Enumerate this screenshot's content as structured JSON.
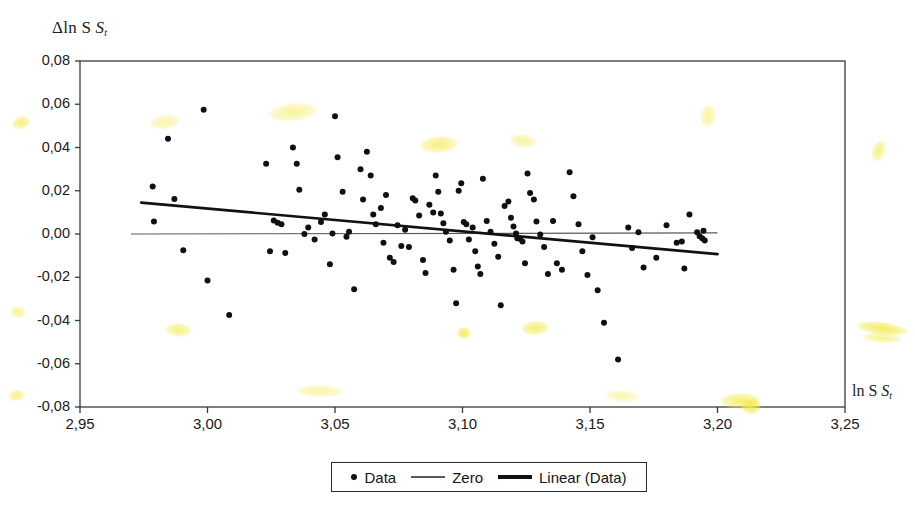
{
  "axes": {
    "y_title": "Δln S",
    "y_title_sub": "t",
    "x_title": "ln S",
    "x_title_sub": "t",
    "y_ticks": [
      "0,08",
      "0,06",
      "0,04",
      "0,02",
      "0,00",
      "-0,02",
      "-0,04",
      "-0,06",
      "-0,08"
    ],
    "x_ticks": [
      "2,95",
      "3,00",
      "3,05",
      "3,10",
      "3,15",
      "3,20",
      "3,25"
    ]
  },
  "legend": {
    "items": [
      {
        "label": "Data",
        "marker": "dot-marker"
      },
      {
        "label": "Zero",
        "marker": "thin-line-marker"
      },
      {
        "label": "Linear (Data)",
        "marker": "thick-line-marker"
      }
    ]
  },
  "colors": {
    "marker": "#101010",
    "zero_line": "#5a5a5a",
    "trend_line": "#121212",
    "axis": "#3a3a3a",
    "highlighter": "#f2ea4c"
  },
  "chart_data": {
    "type": "scatter",
    "title": "",
    "xlabel": "ln S_t",
    "ylabel": "Δln S_t",
    "xlim": [
      2.95,
      3.25
    ],
    "ylim": [
      -0.08,
      0.08
    ],
    "xticks": [
      2.95,
      3.0,
      3.05,
      3.1,
      3.15,
      3.2,
      3.25
    ],
    "yticks": [
      -0.08,
      -0.06,
      -0.04,
      -0.02,
      0.0,
      0.02,
      0.04,
      0.06,
      0.08
    ],
    "grid": false,
    "legend_position": "bottom",
    "series": [
      {
        "name": "Data",
        "type": "scatter",
        "points": [
          [
            2.9785,
            0.022
          ],
          [
            2.979,
            0.0058
          ],
          [
            2.9845,
            0.044
          ],
          [
            2.987,
            0.0162
          ],
          [
            2.9905,
            -0.0075
          ],
          [
            2.9985,
            0.0575
          ],
          [
            3.0,
            -0.0215
          ],
          [
            3.0085,
            -0.0375
          ],
          [
            3.023,
            0.0325
          ],
          [
            3.0245,
            -0.008
          ],
          [
            3.026,
            0.0062
          ],
          [
            3.0275,
            0.0052
          ],
          [
            3.029,
            0.0045
          ],
          [
            3.0305,
            -0.0088
          ],
          [
            3.0335,
            0.04
          ],
          [
            3.035,
            0.0325
          ],
          [
            3.036,
            0.0205
          ],
          [
            3.038,
            0.0
          ],
          [
            3.0395,
            0.003
          ],
          [
            3.042,
            -0.0025
          ],
          [
            3.0445,
            0.0055
          ],
          [
            3.046,
            0.009
          ],
          [
            3.048,
            -0.014
          ],
          [
            3.049,
            0.0002
          ],
          [
            3.05,
            0.0545
          ],
          [
            3.051,
            0.0355
          ],
          [
            3.053,
            0.0195
          ],
          [
            3.0545,
            -0.0013
          ],
          [
            3.0555,
            0.001
          ],
          [
            3.0575,
            -0.0255
          ],
          [
            3.06,
            0.03
          ],
          [
            3.061,
            0.016
          ],
          [
            3.0625,
            0.038
          ],
          [
            3.064,
            0.027
          ],
          [
            3.065,
            0.009
          ],
          [
            3.066,
            0.0045
          ],
          [
            3.068,
            0.012
          ],
          [
            3.069,
            -0.004
          ],
          [
            3.07,
            0.018
          ],
          [
            3.0715,
            -0.011
          ],
          [
            3.073,
            -0.013
          ],
          [
            3.0745,
            0.004
          ],
          [
            3.076,
            -0.0055
          ],
          [
            3.0775,
            0.002
          ],
          [
            3.079,
            -0.006
          ],
          [
            3.0805,
            0.0165
          ],
          [
            3.0815,
            0.0155
          ],
          [
            3.083,
            0.0085
          ],
          [
            3.0845,
            -0.012
          ],
          [
            3.0855,
            -0.018
          ],
          [
            3.087,
            0.0135
          ],
          [
            3.0885,
            0.01
          ],
          [
            3.0895,
            0.027
          ],
          [
            3.0905,
            0.0195
          ],
          [
            3.0915,
            0.0095
          ],
          [
            3.0925,
            0.005
          ],
          [
            3.0935,
            0.001
          ],
          [
            3.095,
            -0.003
          ],
          [
            3.0965,
            -0.0165
          ],
          [
            3.0975,
            -0.032
          ],
          [
            3.0985,
            0.02
          ],
          [
            3.0995,
            0.0235
          ],
          [
            3.1005,
            0.0055
          ],
          [
            3.1015,
            0.0045
          ],
          [
            3.1025,
            -0.0025
          ],
          [
            3.104,
            0.003
          ],
          [
            3.105,
            -0.008
          ],
          [
            3.106,
            -0.015
          ],
          [
            3.107,
            -0.0185
          ],
          [
            3.108,
            0.0255
          ],
          [
            3.1095,
            0.006
          ],
          [
            3.111,
            0.001
          ],
          [
            3.1125,
            -0.0045
          ],
          [
            3.114,
            -0.0105
          ],
          [
            3.115,
            -0.033
          ],
          [
            3.1165,
            0.013
          ],
          [
            3.118,
            0.015
          ],
          [
            3.119,
            0.0075
          ],
          [
            3.12,
            0.0035
          ],
          [
            3.121,
            0.0002
          ],
          [
            3.1215,
            -0.002
          ],
          [
            3.1225,
            -0.0022
          ],
          [
            3.1235,
            -0.0035
          ],
          [
            3.1245,
            -0.0135
          ],
          [
            3.1255,
            0.028
          ],
          [
            3.1265,
            0.019
          ],
          [
            3.128,
            0.016
          ],
          [
            3.129,
            0.0058
          ],
          [
            3.1305,
            -0.0002
          ],
          [
            3.132,
            -0.006
          ],
          [
            3.1335,
            -0.0185
          ],
          [
            3.1355,
            0.006
          ],
          [
            3.137,
            -0.0135
          ],
          [
            3.139,
            -0.0165
          ],
          [
            3.142,
            0.0285
          ],
          [
            3.1435,
            0.0175
          ],
          [
            3.1455,
            0.0045
          ],
          [
            3.147,
            -0.008
          ],
          [
            3.149,
            -0.019
          ],
          [
            3.151,
            -0.0015
          ],
          [
            3.153,
            -0.026
          ],
          [
            3.1555,
            -0.041
          ],
          [
            3.161,
            -0.058
          ],
          [
            3.165,
            0.003
          ],
          [
            3.1665,
            -0.0065
          ],
          [
            3.169,
            0.0008
          ],
          [
            3.171,
            -0.0155
          ],
          [
            3.176,
            -0.011
          ],
          [
            3.18,
            0.004
          ],
          [
            3.184,
            -0.004
          ],
          [
            3.186,
            -0.0035
          ],
          [
            3.187,
            -0.016
          ],
          [
            3.189,
            0.009
          ],
          [
            3.192,
            0.0008
          ],
          [
            3.193,
            -0.001
          ],
          [
            3.194,
            -0.002
          ],
          [
            3.1945,
            0.0015
          ],
          [
            3.195,
            -0.003
          ]
        ]
      },
      {
        "name": "Zero",
        "type": "line",
        "points": [
          [
            2.97,
            0.0
          ],
          [
            3.2,
            0.0005
          ]
        ]
      },
      {
        "name": "Linear (Data)",
        "type": "line",
        "points": [
          [
            2.974,
            0.0145
          ],
          [
            3.2,
            -0.0093
          ]
        ]
      }
    ]
  },
  "highlighter_marks": [
    {
      "x": 12,
      "y": 116,
      "w": 18,
      "h": 13,
      "rot": -20,
      "o": 0.72
    },
    {
      "x": 10,
      "y": 306,
      "w": 16,
      "h": 12,
      "rot": 10,
      "o": 0.6
    },
    {
      "x": 8,
      "y": 390,
      "w": 17,
      "h": 11,
      "rot": -10,
      "o": 0.66
    },
    {
      "x": 150,
      "y": 115,
      "w": 30,
      "h": 14,
      "rot": -8,
      "o": 0.5
    },
    {
      "x": 165,
      "y": 323,
      "w": 26,
      "h": 14,
      "rot": 5,
      "o": 0.68
    },
    {
      "x": 268,
      "y": 103,
      "w": 50,
      "h": 18,
      "rot": -6,
      "o": 0.55
    },
    {
      "x": 295,
      "y": 385,
      "w": 48,
      "h": 12,
      "rot": 2,
      "o": 0.5
    },
    {
      "x": 420,
      "y": 136,
      "w": 38,
      "h": 17,
      "rot": -4,
      "o": 0.72
    },
    {
      "x": 457,
      "y": 327,
      "w": 14,
      "h": 12,
      "rot": 0,
      "o": 0.9
    },
    {
      "x": 510,
      "y": 134,
      "w": 26,
      "h": 14,
      "rot": 8,
      "o": 0.55
    },
    {
      "x": 521,
      "y": 321,
      "w": 28,
      "h": 14,
      "rot": -4,
      "o": 0.78
    },
    {
      "x": 605,
      "y": 390,
      "w": 34,
      "h": 12,
      "rot": 3,
      "o": 0.45
    },
    {
      "x": 700,
      "y": 105,
      "w": 16,
      "h": 22,
      "rot": 12,
      "o": 0.55
    },
    {
      "x": 720,
      "y": 393,
      "w": 40,
      "h": 16,
      "rot": 0,
      "o": 0.78
    },
    {
      "x": 741,
      "y": 398,
      "w": 20,
      "h": 16,
      "rot": 0,
      "o": 0.92
    },
    {
      "x": 872,
      "y": 140,
      "w": 13,
      "h": 22,
      "rot": 18,
      "o": 0.7
    },
    {
      "x": 856,
      "y": 322,
      "w": 52,
      "h": 13,
      "rot": 7,
      "o": 0.88
    },
    {
      "x": 862,
      "y": 333,
      "w": 40,
      "h": 10,
      "rot": 4,
      "o": 0.6
    }
  ]
}
